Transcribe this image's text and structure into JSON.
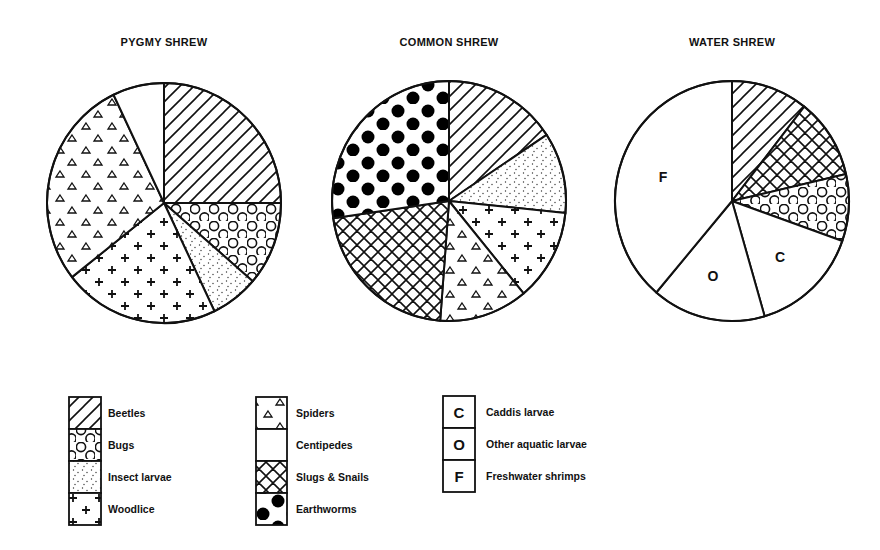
{
  "chart_data": {
    "type": "pie",
    "title": "",
    "charts": [
      {
        "title": "PYGMY SHREW",
        "slices": [
          {
            "category": "Beetles",
            "value": 25.0
          },
          {
            "category": "Bugs",
            "value": 11.3
          },
          {
            "category": "Insect larvae",
            "value": 6.6
          },
          {
            "category": "Woodlice",
            "value": 21.5
          },
          {
            "category": "Spiders",
            "value": 28.5
          },
          {
            "category": "Centipedes",
            "value": 7.1
          }
        ]
      },
      {
        "title": "COMMON SHREW",
        "slices": [
          {
            "category": "Beetles",
            "value": 15.7
          },
          {
            "category": "Insect larvae",
            "value": 10.9
          },
          {
            "category": "Woodlice",
            "value": 12.4
          },
          {
            "category": "Spiders",
            "value": 12.2
          },
          {
            "category": "Slugs & Snails",
            "value": 21.5
          },
          {
            "category": "Earthworms",
            "value": 27.3
          }
        ]
      },
      {
        "title": "WATER SHREW",
        "slices": [
          {
            "category": "Beetles",
            "value": 10.6
          },
          {
            "category": "Slugs & Snails",
            "value": 10.8
          },
          {
            "category": "Bugs",
            "value": 9.0
          },
          {
            "category": "Caddis larvae",
            "value": 15.1,
            "letter": "C"
          },
          {
            "category": "Other aquatic larvae",
            "value": 15.7,
            "letter": "O"
          },
          {
            "category": "Freshwater shrimps",
            "value": 38.8,
            "letter": "F"
          }
        ]
      }
    ],
    "units": "percent of diet",
    "legend": {
      "placement": "bottom-left",
      "columns": [
        [
          {
            "label": "Beetles",
            "pattern": "diagonal-hatch"
          },
          {
            "label": "Bugs",
            "pattern": "circles"
          },
          {
            "label": "Insect larvae",
            "pattern": "fine-dots"
          },
          {
            "label": "Woodlice",
            "pattern": "crosses"
          }
        ],
        [
          {
            "label": "Spiders",
            "pattern": "triangles"
          },
          {
            "label": "Centipedes",
            "pattern": "blank"
          },
          {
            "label": "Slugs & Snails",
            "pattern": "crosshatch"
          },
          {
            "label": "Earthworms",
            "pattern": "filled-dots"
          }
        ],
        [
          {
            "label": "Caddis larvae",
            "pattern": "letter",
            "letter": "C"
          },
          {
            "label": "Other aquatic larvae",
            "pattern": "letter",
            "letter": "O"
          },
          {
            "label": "Freshwater shrimps",
            "pattern": "letter",
            "letter": "F"
          }
        ]
      ]
    }
  }
}
